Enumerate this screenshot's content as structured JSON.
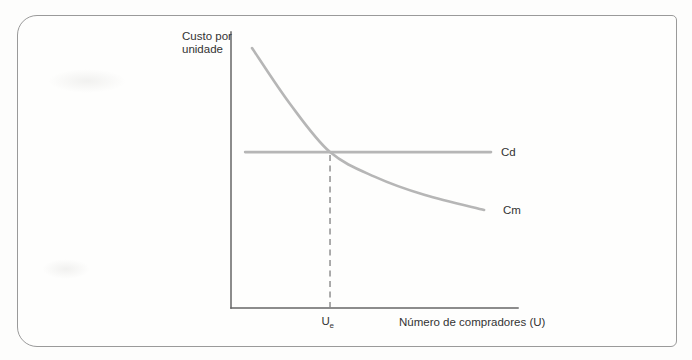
{
  "figure": {
    "y_axis_label": {
      "line1": "Custo por",
      "line2": "unidade"
    },
    "x_axis_label": "Número de compradores (U)",
    "x_tick": {
      "base": "U",
      "sub": "e"
    },
    "curve_labels": {
      "cd": "Cd",
      "cm": "Cm"
    }
  },
  "colors": {
    "curve": "#b6b6b6",
    "axis": "#666666",
    "dashed": "#888888",
    "text": "#333333",
    "frame_border": "#9a9a9a"
  },
  "chart_data": {
    "type": "line",
    "title": "",
    "xlabel": "Número de compradores (U)",
    "ylabel": "Custo por unidade",
    "axes_numeric": false,
    "x_range_relative": [
      0,
      100
    ],
    "y_range_relative": [
      0,
      100
    ],
    "grid": false,
    "legend_position": "inline-right-of-curves",
    "series": [
      {
        "name": "Cd",
        "shape": "horizontal-line",
        "points": [
          [
            4.9,
            56.5
          ],
          [
            90.6,
            56.5
          ]
        ]
      },
      {
        "name": "Cm",
        "shape": "decreasing-convex-curve",
        "points": [
          [
            7.3,
            94.2
          ],
          [
            20.6,
            73.9
          ],
          [
            34.5,
            56.5
          ],
          [
            50.2,
            47.5
          ],
          [
            67.6,
            40.9
          ],
          [
            88.2,
            35.5
          ]
        ]
      }
    ],
    "annotations": [
      {
        "type": "dashed-vertical-line",
        "x": 34.5,
        "from_y": 0,
        "to_y": 56.5,
        "tick_label": "Ue",
        "at": "intersection of Cd and Cm"
      }
    ]
  }
}
